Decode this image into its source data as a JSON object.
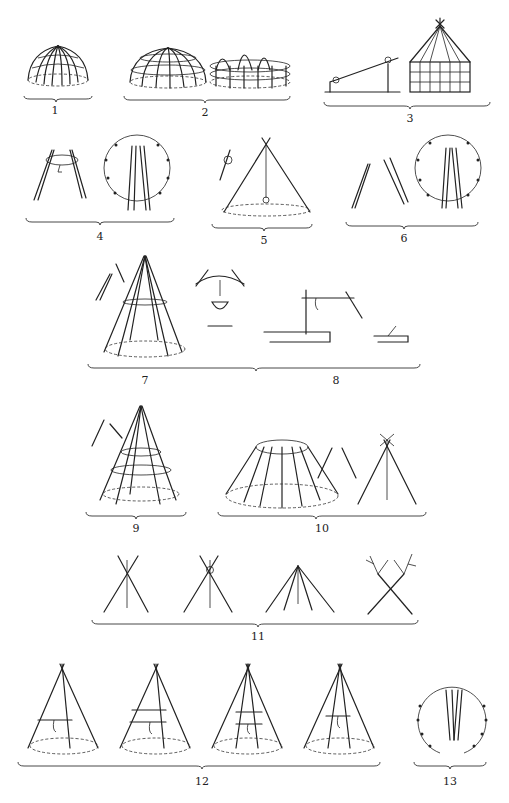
{
  "plate": {
    "description": "Plate of frame constructions for dwellings, hearth hangers and hearth fittings",
    "figures": [
      {
        "number": "1",
        "label": "1",
        "subject": "dome hut frame with radiating bent poles"
      },
      {
        "number": "2",
        "label": "2",
        "subject": "two dome frames with horizontal hoops"
      },
      {
        "number": "3",
        "label": "3",
        "subject": "lean-to pole with pivot and polygonal log house frame with conical roof"
      },
      {
        "number": "4",
        "label": "4",
        "subject": "paired poles joined with ring; plan of pole circle"
      },
      {
        "number": "5",
        "label": "5",
        "subject": "tripod with hanging kettle over hearth"
      },
      {
        "number": "6",
        "label": "6",
        "subject": "forked pole details; plan of pole circle"
      },
      {
        "number": "7",
        "label": "7",
        "subject": "conical tent frame with ring and forked pole detail"
      },
      {
        "number": "8",
        "label": "8",
        "subject": "hearth hanger arch with kettle; crane-type hanger on frame; small frame"
      },
      {
        "number": "9",
        "label": "9",
        "subject": "conical frame with two hoops, forked pole detail"
      },
      {
        "number": "10",
        "label": "10",
        "subject": "truncated conical frame with top ring; forked pole pair; tripod"
      },
      {
        "number": "11",
        "label": "11",
        "subject": "four ways of tying the top of tripod poles"
      },
      {
        "number": "12",
        "label": "12",
        "subject": "four conical tents with crossbars and hanging hooks over hearth"
      },
      {
        "number": "13",
        "label": "13",
        "subject": "plan of pole circle with entrance"
      }
    ]
  },
  "labels": {
    "f1": "1",
    "f2": "2",
    "f3": "3",
    "f4": "4",
    "f5": "5",
    "f6": "6",
    "f7": "7",
    "f8": "8",
    "f9": "9",
    "f10": "10",
    "f11": "11",
    "f12": "12",
    "f13": "13"
  },
  "colors": {
    "ink": "#222222",
    "paper": "#ffffff"
  }
}
